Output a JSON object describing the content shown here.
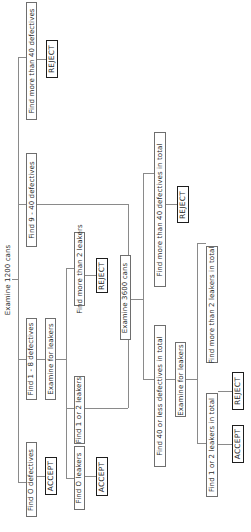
{
  "diagram": {
    "title": "Examine 1200 cans",
    "root_branches": {
      "more_than_40": {
        "label": "Find more than 40 defectives",
        "outcome": "REJECT"
      },
      "nine_to_40": {
        "label": "Find 9 - 40 defectives",
        "next_step": {
          "label": "Examine 3600 cans",
          "branches": {
            "more_than_40_total": {
              "label": "Find more than 40 defectives in total",
              "outcome": "REJECT"
            },
            "forty_or_less_total": {
              "label": "Find 40 or less defectives in total",
              "next_step": {
                "label": "Examine for leakers",
                "branches": {
                  "more_than_2_leakers_total": {
                    "label": "Find more than 2 leakers in total",
                    "outcome": "REJECT"
                  },
                  "one_or_two_leakers_total": {
                    "label": "Find 1 or 2 leakers in total",
                    "outcome": "ACCEPT"
                  }
                }
              }
            }
          }
        }
      },
      "one_to_8": {
        "label": "Find 1 - 8 defectives",
        "next_step": {
          "label": "Examine for leakers",
          "branches": {
            "more_than_2_leakers": {
              "label": "Find more than 2 leakers",
              "outcome": "REJECT"
            },
            "one_or_two_leakers": {
              "label": "Find 1 or 2 leakers"
            },
            "zero_leakers": {
              "label": "Find O leakers",
              "outcome": "ACCEPT"
            }
          }
        }
      },
      "zero": {
        "label": "Find O defectives",
        "outcome": "ACCEPT"
      }
    },
    "colors": {
      "line": "#8a8a8a",
      "box_border": "#6e6e6e",
      "outcome_border": "#1e1e1e",
      "text": "#2a2a2a",
      "background": "#ffffff"
    },
    "orientation": "rotated -90deg (text reads bottom-to-top)"
  }
}
